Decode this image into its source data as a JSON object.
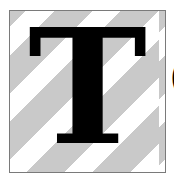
{
  "logo": {
    "letter": "T",
    "stripe_color": "#c9c9c9",
    "border_color": "#7a7a7a",
    "letter_color": "#000000"
  },
  "trailing_text": {
    "visible_fragment": "("
  }
}
